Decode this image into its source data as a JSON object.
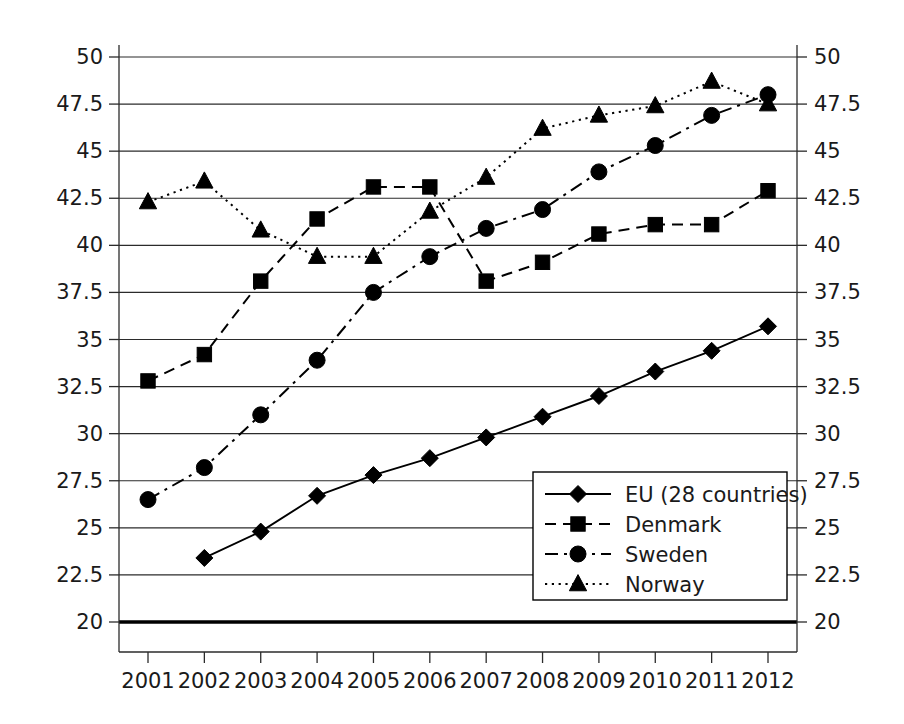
{
  "chart_data": {
    "type": "line",
    "title": "",
    "xlabel": "",
    "ylabel": "",
    "categories": [
      "2001",
      "2002",
      "2003",
      "2004",
      "2005",
      "2006",
      "2007",
      "2008",
      "2009",
      "2010",
      "2011",
      "2012"
    ],
    "ylim": [
      20,
      50
    ],
    "y_ticks": [
      "20",
      "22.5",
      "25",
      "27.5",
      "30",
      "32.5",
      "35",
      "37.5",
      "40",
      "42.5",
      "45",
      "47.5",
      "50"
    ],
    "y_tick_values": [
      20,
      22.5,
      25,
      27.5,
      30,
      32.5,
      35,
      37.5,
      40,
      42.5,
      45,
      47.5,
      50
    ],
    "grid": true,
    "right_axis": true,
    "right_y_ticks": [
      "20",
      "22.5",
      "25",
      "27.5",
      "30",
      "32.5",
      "35",
      "37.5",
      "40",
      "42.5",
      "45",
      "47.5",
      "50"
    ],
    "legend_position": "bottom-right-inside",
    "series": [
      {
        "name": "EU (28 countries)",
        "marker": "diamond",
        "dash": "solid",
        "values": [
          null,
          23.4,
          24.8,
          26.7,
          27.8,
          28.7,
          29.8,
          30.9,
          32.0,
          33.3,
          34.4,
          35.7
        ]
      },
      {
        "name": "Denmark",
        "marker": "square",
        "dash": "dashed",
        "values": [
          32.8,
          34.2,
          38.1,
          41.4,
          43.1,
          43.1,
          38.1,
          39.1,
          40.6,
          41.1,
          41.1,
          42.9
        ]
      },
      {
        "name": "Sweden",
        "marker": "circle",
        "dash": "dashdot",
        "values": [
          26.5,
          28.2,
          31.0,
          33.9,
          37.5,
          39.4,
          40.9,
          41.9,
          43.9,
          45.3,
          46.9,
          48.0
        ]
      },
      {
        "name": "Norway",
        "marker": "triangle",
        "dash": "dotted",
        "values": [
          42.3,
          43.4,
          40.8,
          39.4,
          39.4,
          41.8,
          43.6,
          46.2,
          46.9,
          47.4,
          48.7,
          47.5
        ]
      }
    ]
  },
  "legend": {
    "entries": [
      {
        "label": "EU (28 countries)"
      },
      {
        "label": "Denmark"
      },
      {
        "label": "Sweden"
      },
      {
        "label": "Norway"
      }
    ]
  },
  "colors": {
    "series": "#000000",
    "grid": "#2b2b2b",
    "background": "#ffffff"
  }
}
